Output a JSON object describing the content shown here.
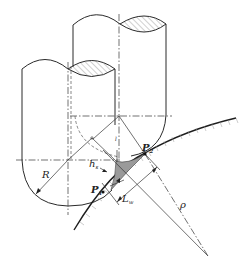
{
  "diagram": {
    "labels": {
      "radius": "R",
      "curvature_radius": "ρ",
      "scallop_height": "h",
      "scallop_height_sub": "s",
      "step_length": "L",
      "step_length_sub": "w",
      "point_1": "P",
      "point_1_sub": "1",
      "point_2": "P",
      "point_2_sub": "2",
      "axis_mark": "l"
    },
    "colors": {
      "line": "#2a2a2a",
      "scallop_fill": "#9a9a9a",
      "hatch": "#555555",
      "background": "#ffffff"
    }
  }
}
